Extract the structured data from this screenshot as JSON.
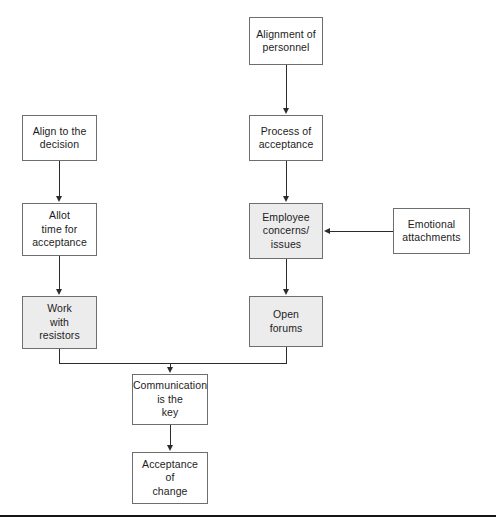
{
  "diagram": {
    "type": "flowchart",
    "title": "",
    "orientation": "top-to-bottom",
    "nodes": [
      {
        "id": "alignment-of-personnel",
        "label": "Alignment of\npersonnel",
        "x": 249,
        "y": 17,
        "w": 74,
        "h": 48,
        "fill": "#ffffff"
      },
      {
        "id": "align-to-the-decision",
        "label": "Align to the\ndecision",
        "x": 22,
        "y": 115,
        "w": 75,
        "h": 46,
        "fill": "#ffffff"
      },
      {
        "id": "process-of-acceptance",
        "label": "Process of\nacceptance",
        "x": 249,
        "y": 115,
        "w": 74,
        "h": 46,
        "fill": "#ffffff"
      },
      {
        "id": "allot-time-for-acceptance",
        "label": "Allot\ntime for\nacceptance",
        "x": 22,
        "y": 203,
        "w": 75,
        "h": 53,
        "fill": "#ffffff"
      },
      {
        "id": "employee-concerns-issues",
        "label": "Employee\nconcerns/\nissues",
        "x": 249,
        "y": 203,
        "w": 74,
        "h": 56,
        "fill": "#ececed"
      },
      {
        "id": "emotional-attachments",
        "label": "Emotional\nattachments",
        "x": 393,
        "y": 208,
        "w": 77,
        "h": 46,
        "fill": "#ffffff"
      },
      {
        "id": "work-with-resistors",
        "label": "Work\nwith\nresistors",
        "x": 22,
        "y": 296,
        "w": 75,
        "h": 53,
        "fill": "#ececed"
      },
      {
        "id": "open-forums",
        "label": "Open\nforums",
        "x": 249,
        "y": 296,
        "w": 74,
        "h": 51,
        "fill": "#ececed"
      },
      {
        "id": "communication-is-the-key",
        "label": "Communication\nis the\nkey",
        "x": 132,
        "y": 374,
        "w": 76,
        "h": 51,
        "fill": "#ffffff"
      },
      {
        "id": "acceptance-of-change",
        "label": "Acceptance\nof\nchange",
        "x": 132,
        "y": 452,
        "w": 76,
        "h": 52,
        "fill": "#ffffff"
      }
    ],
    "edges": [
      {
        "from": "alignment-of-personnel",
        "to": "process-of-acceptance",
        "direction": "down"
      },
      {
        "from": "align-to-the-decision",
        "to": "allot-time-for-acceptance",
        "direction": "down"
      },
      {
        "from": "process-of-acceptance",
        "to": "employee-concerns-issues",
        "direction": "down"
      },
      {
        "from": "allot-time-for-acceptance",
        "to": "work-with-resistors",
        "direction": "down"
      },
      {
        "from": "emotional-attachments",
        "to": "employee-concerns-issues",
        "direction": "left"
      },
      {
        "from": "employee-concerns-issues",
        "to": "open-forums",
        "direction": "down"
      },
      {
        "from": "work-with-resistors",
        "to": "communication-is-the-key",
        "direction": "elbow-down"
      },
      {
        "from": "open-forums",
        "to": "communication-is-the-key",
        "direction": "elbow-down"
      },
      {
        "from": "communication-is-the-key",
        "to": "acceptance-of-change",
        "direction": "down"
      }
    ]
  },
  "labels": {
    "alignment_of_personnel": "Alignment of\npersonnel",
    "align_to_the_decision": "Align to the\ndecision",
    "process_of_acceptance": "Process of\nacceptance",
    "allot_time_for_acceptance": "Allot\ntime for\nacceptance",
    "employee_concerns_issues": "Employee\nconcerns/\nissues",
    "emotional_attachments": "Emotional\nattachments",
    "work_with_resistors": "Work\nwith\nresistors",
    "open_forums": "Open\nforums",
    "communication_is_the_key": "Communication\nis the\nkey",
    "acceptance_of_change": "Acceptance\nof\nchange"
  },
  "colors": {
    "box_border": "#6e6e6e",
    "box_fill_plain": "#ffffff",
    "box_fill_shaded": "#ececed",
    "connector": "#2b2b2b",
    "text": "#1c1c1c",
    "page_rule": "#151515"
  }
}
